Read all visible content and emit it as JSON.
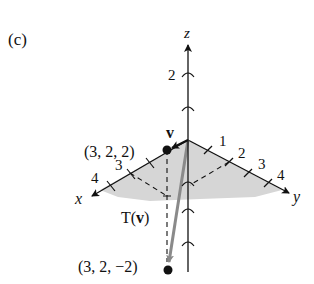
{
  "panel_label": "(c)",
  "axes": {
    "x_label": "x",
    "y_label": "y",
    "z_label": "z",
    "x_ticks": [
      "3",
      "4"
    ],
    "y_ticks": [
      "1",
      "2",
      "3",
      "4"
    ],
    "z_ticks": [
      "2"
    ]
  },
  "points": {
    "v": {
      "label": "(3, 2, 2)",
      "name": "v"
    },
    "Tv": {
      "label": "(3, 2, −2)",
      "name": "T(v)"
    }
  },
  "vector_labels": {
    "v": "v",
    "T_prefix": "T(",
    "T_v": "v",
    "T_suffix": ")"
  },
  "colors": {
    "shade": "#d6d6d6",
    "axis": "#111111",
    "vector": "#888888"
  }
}
